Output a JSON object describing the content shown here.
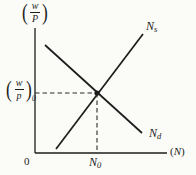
{
  "figure": {
    "type": "labor-market-equilibrium-diagram",
    "line_color": "#1c1c1c",
    "background": "#fbfbf8",
    "labels": {
      "y_axis": {
        "open": "(",
        "numerator": "w",
        "denominator": "P",
        "close": ")"
      },
      "eq_wage": {
        "open": "(",
        "numerator": "w",
        "denominator": "p",
        "close": ")",
        "subscript": "0"
      },
      "supply": {
        "base": "N",
        "subscript": "s"
      },
      "demand": {
        "base": "N",
        "subscript": "d"
      },
      "eq_labor": {
        "base": "N",
        "subscript": "0"
      },
      "origin": "0",
      "x_axis": {
        "open": "(",
        "base": "N",
        "close": ")"
      }
    },
    "curves": [
      {
        "name": "labor-supply",
        "label": "Ns",
        "slope": "upward"
      },
      {
        "name": "labor-demand",
        "label": "Nd",
        "slope": "downward"
      }
    ],
    "equilibrium": {
      "wage_label": "(w/p)0",
      "labor_label": "N0"
    }
  }
}
